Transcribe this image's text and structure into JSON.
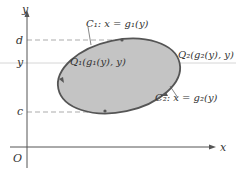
{
  "diagram": {
    "axes": {
      "x_label": "x",
      "y_label": "y",
      "origin_label": "O"
    },
    "ticks": {
      "d": "d",
      "y": "y",
      "c": "c"
    },
    "curves": {
      "c1_label": "C₁: x = g₁(y)",
      "c2_label": "C₂: x = g₂(y)"
    },
    "points": {
      "q1_label": "Q₁(g₁(y), y)",
      "q2_label": "Q₂(g₂(y), y)"
    },
    "colors": {
      "region_fill": "#c4c4c4",
      "boundary": "#555555",
      "axis": "#555555",
      "dashed": "#888888",
      "text": "#333333"
    }
  }
}
